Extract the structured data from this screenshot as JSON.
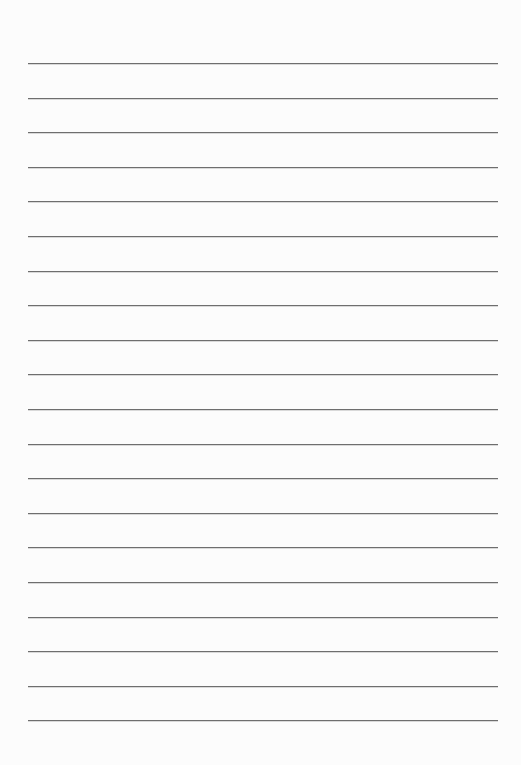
{
  "page": {
    "type": "lined-paper",
    "background": "#fcfcfc",
    "line_color": "#6e6e6e",
    "line_count": 20,
    "first_line_y": 63,
    "line_spacing": 34.6,
    "line_left": 28,
    "line_width": 470
  }
}
